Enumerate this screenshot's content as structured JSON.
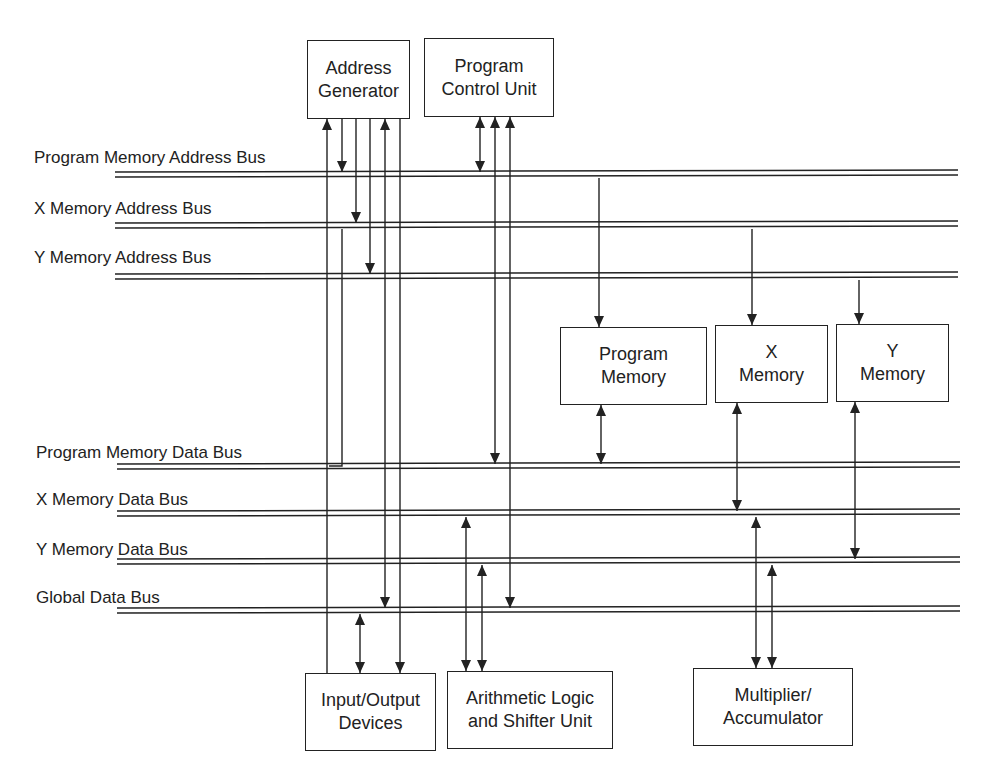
{
  "diagram": {
    "colors": {
      "line": "#222222",
      "background": "#ffffff"
    },
    "buses": [
      {
        "id": "pmab",
        "label": "Program Memory Address Bus",
        "label_x": 34,
        "label_y": 148,
        "x1": 115,
        "x2": 958,
        "y": 174
      },
      {
        "id": "xmab",
        "label": "X Memory Address Bus",
        "label_x": 34,
        "label_y": 199,
        "x1": 115,
        "x2": 958,
        "y": 225
      },
      {
        "id": "ymab",
        "label": "Y Memory Address Bus",
        "label_x": 34,
        "label_y": 248,
        "x1": 115,
        "x2": 958,
        "y": 276
      },
      {
        "id": "pmdb",
        "label": "Program Memory Data Bus",
        "label_x": 36,
        "label_y": 443,
        "x1": 117,
        "x2": 960,
        "y": 466
      },
      {
        "id": "xmdb",
        "label": "X Memory Data Bus",
        "label_x": 36,
        "label_y": 490,
        "x1": 117,
        "x2": 960,
        "y": 513
      },
      {
        "id": "ymdb",
        "label": "Y Memory Data Bus",
        "label_x": 36,
        "label_y": 540,
        "x1": 117,
        "x2": 960,
        "y": 561
      },
      {
        "id": "gdb",
        "label": "Global Data Bus",
        "label_x": 36,
        "label_y": 588,
        "x1": 117,
        "x2": 960,
        "y": 610
      }
    ],
    "blocks": [
      {
        "id": "address-generator",
        "lines": [
          "Address",
          "Generator"
        ],
        "x": 307,
        "y": 40,
        "w": 103,
        "h": 79
      },
      {
        "id": "program-control-unit",
        "lines": [
          "Program",
          "Control Unit"
        ],
        "x": 424,
        "y": 38,
        "w": 130,
        "h": 79
      },
      {
        "id": "program-memory",
        "lines": [
          "Program",
          "Memory"
        ],
        "x": 560,
        "y": 327,
        "w": 147,
        "h": 78
      },
      {
        "id": "x-memory",
        "lines": [
          "X",
          "Memory"
        ],
        "x": 715,
        "y": 325,
        "w": 113,
        "h": 78
      },
      {
        "id": "y-memory",
        "lines": [
          "Y",
          "Memory"
        ],
        "x": 836,
        "y": 324,
        "w": 113,
        "h": 78
      },
      {
        "id": "io-devices",
        "lines": [
          "Input/Output",
          "Devices"
        ],
        "x": 305,
        "y": 673,
        "w": 131,
        "h": 78
      },
      {
        "id": "alu-shifter",
        "lines": [
          "Arithmetic Logic",
          "and Shifter Unit"
        ],
        "x": 447,
        "y": 671,
        "w": 166,
        "h": 78
      },
      {
        "id": "multiplier-accumulator",
        "lines": [
          "Multiplier/",
          "Accumulator"
        ],
        "x": 693,
        "y": 668,
        "w": 160,
        "h": 78
      }
    ],
    "connections": [
      {
        "from": "address-generator",
        "to": "io-devices",
        "x": 327,
        "y1": 119,
        "y2": 673,
        "arrow_start": true,
        "arrow_end": false,
        "note": "AG vertical to I/O"
      },
      {
        "from": "address-generator",
        "to": "pmab",
        "x": 342,
        "y1": 119,
        "y2": 172,
        "arrow_start": false,
        "arrow_end": true
      },
      {
        "from": "xmab",
        "to": "pmdb",
        "path": [
          [
            342,
            229
          ],
          [
            342,
            466
          ],
          [
            329,
            466
          ]
        ],
        "arrow": "none"
      },
      {
        "from": "address-generator",
        "to": "xmab",
        "x": 356,
        "y1": 119,
        "y2": 223,
        "arrow_start": false,
        "arrow_end": true
      },
      {
        "from": "address-generator",
        "to": "ymab",
        "x": 370,
        "y1": 119,
        "y2": 274,
        "arrow_start": false,
        "arrow_end": true
      },
      {
        "from": "address-generator",
        "to": "gdb",
        "x": 385,
        "y1": 119,
        "y2": 608,
        "arrow_start": true,
        "arrow_end": true
      },
      {
        "from": "address-generator",
        "to": "io-devices",
        "x": 400,
        "y1": 119,
        "y2": 673,
        "arrow_start": false,
        "arrow_end": true
      },
      {
        "from": "program-control-unit",
        "to": "pmab",
        "x": 480,
        "y1": 117,
        "y2": 172,
        "arrow_start": true,
        "arrow_end": true
      },
      {
        "from": "program-control-unit",
        "to": "pmdb",
        "x": 495,
        "y1": 117,
        "y2": 464,
        "arrow_start": true,
        "arrow_end": true
      },
      {
        "from": "program-control-unit",
        "to": "gdb",
        "x": 510,
        "y1": 117,
        "y2": 608,
        "arrow_start": true,
        "arrow_end": true
      },
      {
        "from": "pmab",
        "to": "program-memory",
        "x": 599,
        "y1": 178,
        "y2": 327,
        "arrow_start": false,
        "arrow_end": true
      },
      {
        "from": "xmab",
        "to": "x-memory",
        "x": 752,
        "y1": 229,
        "y2": 325,
        "arrow_start": false,
        "arrow_end": true
      },
      {
        "from": "ymab",
        "to": "y-memory",
        "x": 859,
        "y1": 280,
        "y2": 324,
        "arrow_start": false,
        "arrow_end": true
      },
      {
        "from": "program-memory",
        "to": "pmdb",
        "x": 601,
        "y1": 405,
        "y2": 464,
        "arrow_start": true,
        "arrow_end": true
      },
      {
        "from": "x-memory",
        "to": "xmdb",
        "x": 737,
        "y1": 403,
        "y2": 511,
        "arrow_start": true,
        "arrow_end": true
      },
      {
        "from": "y-memory",
        "to": "ymdb",
        "x": 855,
        "y1": 402,
        "y2": 559,
        "arrow_start": true,
        "arrow_end": true
      },
      {
        "from": "gdb",
        "to": "io-devices",
        "x": 360,
        "y1": 614,
        "y2": 673,
        "arrow_start": true,
        "arrow_end": true
      },
      {
        "from": "xmdb",
        "to": "alu-shifter",
        "x": 466,
        "y1": 517,
        "y2": 671,
        "arrow_start": true,
        "arrow_end": true
      },
      {
        "from": "ymdb",
        "to": "alu-shifter",
        "x": 482,
        "y1": 565,
        "y2": 671,
        "arrow_start": true,
        "arrow_end": true
      },
      {
        "from": "xmdb",
        "to": "multiplier-accumulator",
        "x": 756,
        "y1": 517,
        "y2": 668,
        "arrow_start": true,
        "arrow_end": true
      },
      {
        "from": "ymdb",
        "to": "multiplier-accumulator",
        "x": 772,
        "y1": 565,
        "y2": 668,
        "arrow_start": true,
        "arrow_end": true
      }
    ]
  }
}
